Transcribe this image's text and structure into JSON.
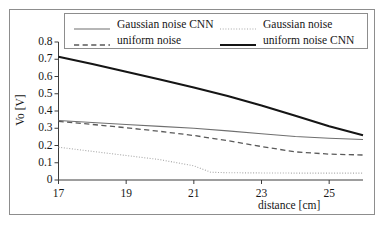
{
  "chart_data": {
    "type": "line",
    "title": "",
    "xlabel": "distance [cm]",
    "ylabel": "Vo [V]",
    "xlim": [
      17,
      26
    ],
    "ylim": [
      0,
      0.8
    ],
    "grid": false,
    "legend_position": "top-inside",
    "xticks": [
      "17",
      "19",
      "21",
      "23",
      "25"
    ],
    "xtick_values": [
      17,
      19,
      21,
      23,
      25
    ],
    "yticks": [
      "0",
      "0.1",
      "0.2",
      "0.3",
      "0.4",
      "0.5",
      "0.6",
      "0.7",
      "0.8"
    ],
    "ytick_values": [
      0,
      0.1,
      0.2,
      0.3,
      0.4,
      0.5,
      0.6,
      0.7,
      0.8
    ],
    "series": [
      {
        "name": "Gaussian noise CNN",
        "style": "solid",
        "color": "#6f6f6f",
        "width": 1.1,
        "x": [
          17,
          18,
          19,
          20,
          21,
          22,
          23,
          24,
          25,
          26
        ],
        "values": [
          0.345,
          0.333,
          0.322,
          0.311,
          0.3,
          0.285,
          0.268,
          0.252,
          0.242,
          0.235
        ]
      },
      {
        "name": "Gaussian noise",
        "style": "dotted",
        "color": "#a8a8a8",
        "width": 1.1,
        "x": [
          17,
          18,
          19,
          20,
          21,
          21.5,
          22,
          23,
          24,
          25,
          26
        ],
        "values": [
          0.19,
          0.166,
          0.142,
          0.118,
          0.082,
          0.045,
          0.042,
          0.041,
          0.04,
          0.04,
          0.04
        ]
      },
      {
        "name": "uniform noise",
        "style": "dashed",
        "color": "#5a5a5a",
        "width": 1.3,
        "x": [
          17,
          18,
          19,
          20,
          21,
          22,
          23,
          24,
          25,
          26
        ],
        "values": [
          0.34,
          0.322,
          0.303,
          0.282,
          0.258,
          0.228,
          0.194,
          0.163,
          0.15,
          0.145
        ]
      },
      {
        "name": "uniform noise CNN",
        "style": "solid",
        "color": "#151515",
        "width": 2.1,
        "x": [
          17,
          18,
          19,
          20,
          21,
          22,
          23,
          24,
          25,
          26
        ],
        "values": [
          0.715,
          0.672,
          0.628,
          0.583,
          0.536,
          0.487,
          0.432,
          0.372,
          0.312,
          0.26
        ]
      }
    ]
  },
  "legend": {
    "entries": [
      {
        "label": "Gaussian noise CNN",
        "series": 0
      },
      {
        "label": "Gaussian noise",
        "series": 1
      },
      {
        "label": "uniform noise",
        "series": 2
      },
      {
        "label": "uniform noise CNN",
        "series": 3
      }
    ]
  },
  "axes": {
    "axis_color": "#3c3c3c",
    "frame_color": "#8d8d8d"
  }
}
